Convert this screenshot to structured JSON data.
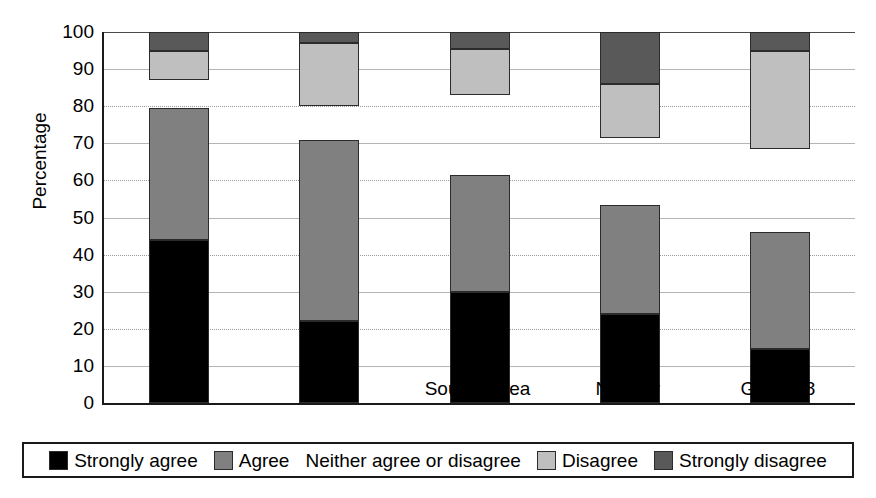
{
  "chart_data": {
    "type": "bar",
    "subtype": "stacked-bar-100",
    "title": "",
    "xlabel": "",
    "ylabel": "Percentage",
    "ylim": [
      0,
      100
    ],
    "yticks": [
      0,
      10,
      20,
      30,
      40,
      50,
      60,
      70,
      80,
      90,
      100
    ],
    "grid": true,
    "legend_position": "bottom",
    "categories": [
      "India",
      "China",
      "South Korea",
      "Norway",
      "GB 2008"
    ],
    "series": [
      {
        "name": "Strongly agree",
        "color": "#000000",
        "values": [
          44,
          22,
          30,
          24,
          14.5
        ]
      },
      {
        "name": "Agree",
        "color": "#808080",
        "values": [
          35.5,
          49,
          31.5,
          29.3,
          31.5
        ]
      },
      {
        "name": "Neither agree or disagree",
        "color": "#ffffff",
        "values": [
          7.5,
          9,
          21.5,
          18,
          22.5
        ]
      },
      {
        "name": "Disagree",
        "color": "#bfbfbf",
        "values": [
          8,
          17,
          12.5,
          14.7,
          26.5
        ]
      },
      {
        "name": "Strongly disagree",
        "color": "#595959",
        "values": [
          5,
          3,
          4.5,
          14,
          5
        ]
      }
    ]
  },
  "legend": {
    "items": [
      {
        "label": "Strongly agree",
        "color": "#000000",
        "has_swatch": true
      },
      {
        "label": "Agree",
        "color": "#808080",
        "has_swatch": true
      },
      {
        "label": "Neither agree or disagree",
        "color": "#ffffff",
        "has_swatch": false
      },
      {
        "label": "Disagree",
        "color": "#bfbfbf",
        "has_swatch": true
      },
      {
        "label": "Strongly disagree",
        "color": "#595959",
        "has_swatch": true
      }
    ]
  },
  "axis": {
    "y_title": "Percentage",
    "y_tick_labels": [
      "100",
      "90",
      "80",
      "70",
      "60",
      "50",
      "40",
      "30",
      "20",
      "10",
      "0"
    ],
    "x_tick_labels": [
      "India",
      "China",
      "South Korea",
      "Norway",
      "GB 2008"
    ]
  }
}
